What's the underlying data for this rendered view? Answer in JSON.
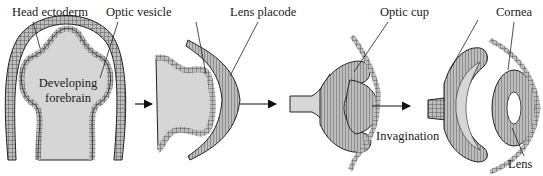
{
  "diagram": {
    "stages": [
      {
        "id": "stage-1",
        "structures": [
          "Head ectoderm",
          "Optic vesicle",
          "Developing forebrain"
        ]
      },
      {
        "id": "stage-2",
        "structures": [
          "Optic vesicle",
          "Lens placode"
        ]
      },
      {
        "id": "stage-3",
        "structures": [
          "Optic cup",
          "Invagination"
        ]
      },
      {
        "id": "stage-4",
        "structures": [
          "Optic cup",
          "Cornea",
          "Lens"
        ]
      }
    ],
    "labels": {
      "head_ectoderm": "Head ectoderm",
      "optic_vesicle": "Optic vesicle",
      "lens_placode": "Lens placode",
      "optic_cup": "Optic cup",
      "cornea": "Cornea",
      "developing": "Developing",
      "forebrain": "forebrain",
      "invagination": "Invagination",
      "lens": "Lens"
    },
    "colors": {
      "tissue_fill": "#d6d6d6",
      "cell_fill": "#bdbdbd",
      "outline": "#222222",
      "background": "#ffffff"
    },
    "arrows": 3
  }
}
